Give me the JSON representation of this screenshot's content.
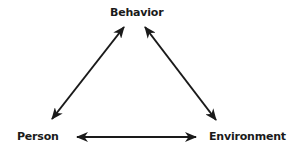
{
  "diagram": {
    "type": "triadic-reciprocal-causation",
    "nodes": [
      {
        "id": "behavior",
        "label": "Behavior",
        "position": "top"
      },
      {
        "id": "person",
        "label": "Person",
        "position": "bottom-left"
      },
      {
        "id": "environment",
        "label": "Environment",
        "position": "bottom-right"
      }
    ],
    "edges": [
      {
        "from": "person",
        "to": "behavior",
        "direction": "bidirectional"
      },
      {
        "from": "behavior",
        "to": "environment",
        "direction": "bidirectional"
      },
      {
        "from": "person",
        "to": "environment",
        "direction": "bidirectional"
      }
    ],
    "colors": {
      "background": "#ffffff",
      "ink": "#1a1a1a"
    }
  }
}
